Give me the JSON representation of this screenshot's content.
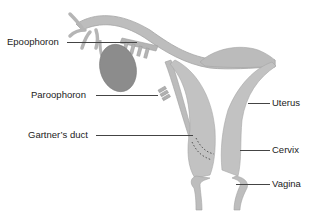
{
  "diagram": {
    "type": "anatomical-illustration",
    "colors": {
      "tissue": "#b9b9b9",
      "tissue_edge": "#9a9a9a",
      "ovary": "#8a8a8a",
      "label_text": "#222222",
      "leader_line": "#444444",
      "background": "#ffffff"
    },
    "labels": [
      {
        "id": "epoophoron",
        "text": "Epoophoron",
        "side": "left"
      },
      {
        "id": "paroophoron",
        "text": "Paroophoron",
        "side": "left"
      },
      {
        "id": "gartners-duct",
        "text": "Gartner’s duct",
        "side": "left"
      },
      {
        "id": "uterus",
        "text": "Uterus",
        "side": "right"
      },
      {
        "id": "cervix",
        "text": "Cervix",
        "side": "right"
      },
      {
        "id": "vagina",
        "text": "Vagina",
        "side": "right"
      }
    ]
  }
}
